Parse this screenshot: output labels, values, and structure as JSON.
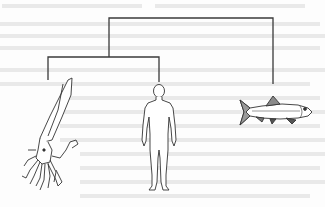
{
  "figure": {
    "type": "cladogram",
    "line_color": "#3a3a3a",
    "taxa": [
      {
        "id": "squid",
        "label": "Squid",
        "x": 48
      },
      {
        "id": "human",
        "label": "Human",
        "x": 159
      },
      {
        "id": "fish",
        "label": "Fish",
        "x": 273
      }
    ],
    "clades": [
      {
        "id": "root",
        "children": [
          "inner",
          "fish"
        ],
        "node_x": 109,
        "y": 18
      },
      {
        "id": "inner",
        "children": [
          "squid",
          "human"
        ],
        "y": 57
      }
    ]
  }
}
